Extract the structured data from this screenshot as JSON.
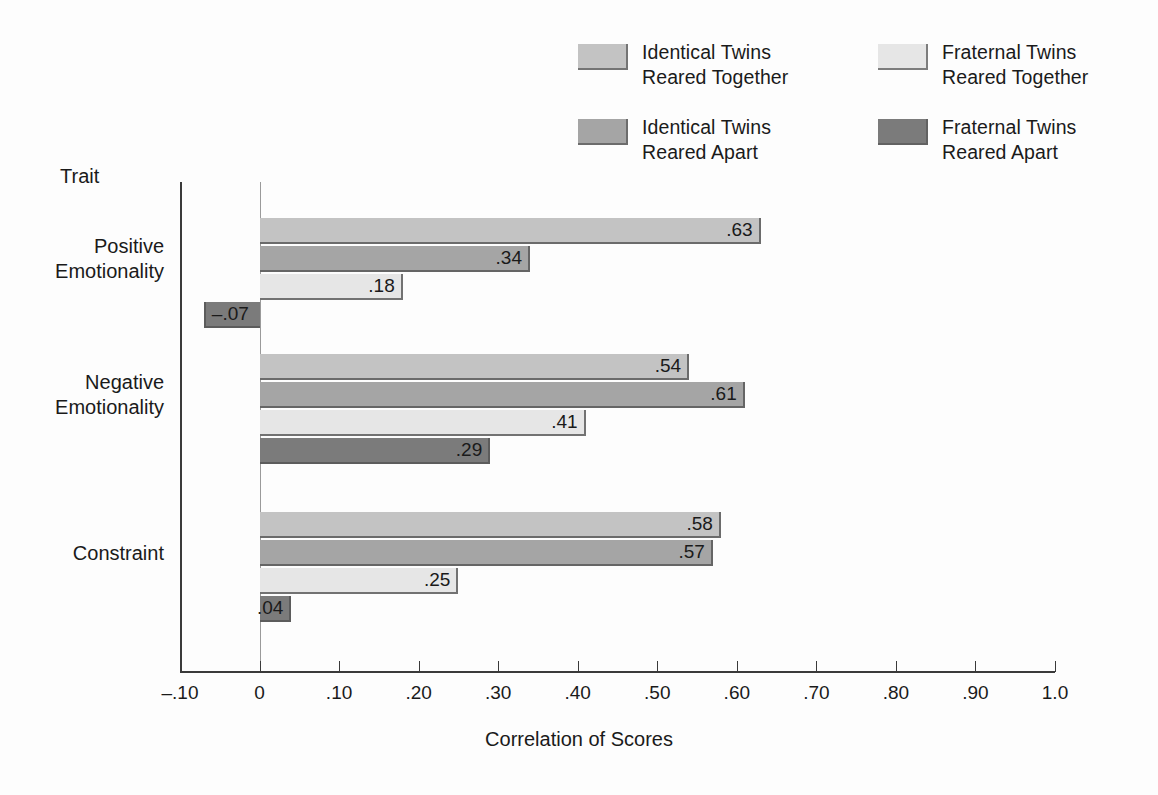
{
  "axis_head": "Trait",
  "legend": {
    "items": [
      {
        "label": "Identical Twins\nReared Together",
        "color": "#c3c3c3",
        "swatch_name": "legend-swatch-identical-together"
      },
      {
        "label": "Fraternal Twins\nReared Together",
        "color": "#e6e6e6",
        "swatch_name": "legend-swatch-fraternal-together"
      },
      {
        "label": "Identical Twins\nReared Apart",
        "color": "#a5a5a5",
        "swatch_name": "legend-swatch-identical-apart"
      },
      {
        "label": "Fraternal Twins\nReared Apart",
        "color": "#7b7b7b",
        "swatch_name": "legend-swatch-fraternal-apart"
      }
    ]
  },
  "chart_data": {
    "type": "bar",
    "orientation": "horizontal",
    "title": "",
    "xlabel": "Correlation of Scores",
    "ylabel": "Trait",
    "xlim": [
      -0.1,
      1.0
    ],
    "grid": false,
    "legend_position": "top-right",
    "xticks": [
      -0.1,
      0,
      0.1,
      0.2,
      0.3,
      0.4,
      0.5,
      0.6,
      0.7,
      0.8,
      0.9,
      1.0
    ],
    "xticklabels": [
      "–.10",
      "0",
      ".10",
      ".20",
      ".30",
      ".40",
      ".50",
      ".60",
      ".70",
      ".80",
      ".90",
      "1.0"
    ],
    "categories": [
      "Positive\nEmotionality",
      "Negative\nEmotionality",
      "Constraint"
    ],
    "series": [
      {
        "name": "Identical Twins Reared Together",
        "color": "#c3c3c3",
        "values": [
          0.63,
          0.54,
          0.58
        ],
        "labels": [
          ".63",
          ".54",
          ".58"
        ]
      },
      {
        "name": "Identical Twins Reared Apart",
        "color": "#a5a5a5",
        "values": [
          0.34,
          0.61,
          0.57
        ],
        "labels": [
          ".34",
          ".61",
          ".57"
        ]
      },
      {
        "name": "Fraternal Twins Reared Together",
        "color": "#e6e6e6",
        "values": [
          0.18,
          0.41,
          0.25
        ],
        "labels": [
          ".18",
          ".41",
          ".25"
        ]
      },
      {
        "name": "Fraternal Twins Reared Apart",
        "color": "#7b7b7b",
        "values": [
          -0.07,
          0.29,
          0.04
        ],
        "labels": [
          "–.07",
          ".29",
          ".04"
        ]
      }
    ]
  }
}
